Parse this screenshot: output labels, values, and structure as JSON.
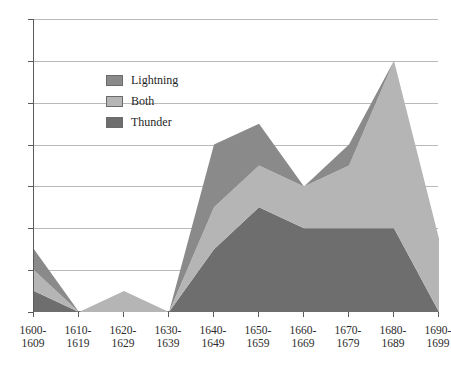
{
  "chart_data": {
    "type": "area",
    "subtype": "stacked-area",
    "title": "",
    "xlabel": "",
    "ylabel": "",
    "ylim": [
      0,
      14
    ],
    "ytick_step": 2,
    "yticks": [
      "0",
      "2",
      "4",
      "6",
      "8",
      "10",
      "12",
      "14"
    ],
    "grid": true,
    "grid_axis": "y",
    "legend_position": "inside-upper-left",
    "categories": [
      "1600-1609",
      "1610-1619",
      "1620-1629",
      "1630-1639",
      "1640-1649",
      "1650-1659",
      "1660-1669",
      "1670-1679",
      "1680-1689",
      "1690-1699"
    ],
    "category_lines": [
      [
        "1600-",
        "1609"
      ],
      [
        "1610-",
        "1619"
      ],
      [
        "1620-",
        "1629"
      ],
      [
        "1630-",
        "1639"
      ],
      [
        "1640-",
        "1649"
      ],
      [
        "1650-",
        "1659"
      ],
      [
        "1660-",
        "1669"
      ],
      [
        "1670-",
        "1679"
      ],
      [
        "1680-",
        "1689"
      ],
      [
        "1690-",
        "1699"
      ]
    ],
    "stack_order_bottom_to_top": [
      "Thunder",
      "Both",
      "Lightning"
    ],
    "series": [
      {
        "name": "Thunder",
        "color": "#6e6e6e",
        "values": [
          1,
          0,
          0,
          0,
          3,
          5,
          4,
          4,
          4,
          0
        ]
      },
      {
        "name": "Both",
        "color": "#b5b5b5",
        "values": [
          1,
          0,
          1,
          0,
          2,
          2,
          2,
          3,
          8,
          3.5
        ]
      },
      {
        "name": "Lightning",
        "color": "#8a8a8a",
        "values": [
          1,
          0,
          0,
          0,
          3,
          2,
          0,
          1,
          0,
          0
        ]
      }
    ],
    "totals": [
      3,
      0,
      1,
      0,
      8,
      9,
      6,
      8,
      12,
      3.5
    ]
  },
  "legend": {
    "items": [
      {
        "label": "Lightning",
        "color": "#8a8a8a"
      },
      {
        "label": "Both",
        "color": "#b5b5b5"
      },
      {
        "label": "Thunder",
        "color": "#6e6e6e"
      }
    ]
  },
  "axes": {
    "y": {
      "ticks": [
        "14",
        "12",
        "10",
        "8",
        "6",
        "4",
        "2",
        "0"
      ]
    }
  }
}
